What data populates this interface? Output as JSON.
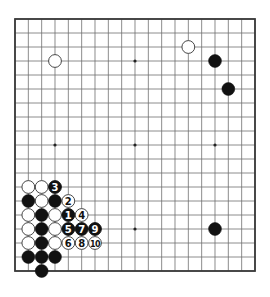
{
  "board": {
    "size": 19,
    "origin_x": 15,
    "origin_y": 19,
    "step_x": 13.333,
    "step_y": 14,
    "line_color": "#6e6e6e",
    "border_color": "#3a3a3a",
    "star_points": [
      [
        3,
        3
      ],
      [
        9,
        3
      ],
      [
        15,
        3
      ],
      [
        3,
        9
      ],
      [
        9,
        9
      ],
      [
        15,
        9
      ],
      [
        3,
        15
      ],
      [
        9,
        15
      ],
      [
        15,
        15
      ]
    ]
  },
  "stones": {
    "white": [
      [
        3,
        3
      ],
      [
        13,
        2
      ],
      [
        1,
        12
      ],
      [
        2,
        12
      ],
      [
        2,
        13
      ],
      [
        1,
        14
      ],
      [
        3,
        14
      ],
      [
        1,
        15
      ],
      [
        3,
        15
      ],
      [
        1,
        16
      ],
      [
        3,
        16
      ]
    ],
    "black": [
      [
        15,
        3
      ],
      [
        16,
        5
      ],
      [
        15,
        15
      ],
      [
        1,
        13
      ],
      [
        3,
        13
      ],
      [
        2,
        14
      ],
      [
        2,
        15
      ],
      [
        2,
        16
      ],
      [
        1,
        17
      ],
      [
        2,
        17
      ],
      [
        3,
        17
      ],
      [
        2,
        18
      ]
    ]
  },
  "moves": [
    {
      "n": "1",
      "color": "black",
      "x": 4,
      "y": 14
    },
    {
      "n": "2",
      "color": "white",
      "x": 4,
      "y": 13
    },
    {
      "n": "3",
      "color": "black",
      "x": 3,
      "y": 12
    },
    {
      "n": "4",
      "color": "white",
      "x": 5,
      "y": 14
    },
    {
      "n": "5",
      "color": "black",
      "x": 4,
      "y": 15
    },
    {
      "n": "6",
      "color": "white",
      "x": 4,
      "y": 16
    },
    {
      "n": "7",
      "color": "black",
      "x": 5,
      "y": 15
    },
    {
      "n": "8",
      "color": "white",
      "x": 5,
      "y": 16
    },
    {
      "n": "9",
      "color": "black",
      "x": 6,
      "y": 15
    },
    {
      "n": "10",
      "color": "white",
      "x": 6,
      "y": 16
    }
  ]
}
